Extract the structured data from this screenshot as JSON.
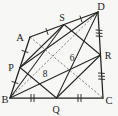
{
  "figure": {
    "background_color": "#fdfdfc",
    "stroke_color": "#202020",
    "dash_color": "#6a6a6a",
    "width": 118,
    "height": 116
  },
  "vertices": {
    "A": {
      "label": "A",
      "x": 30,
      "y": 37,
      "label_x": 21,
      "label_y": 39
    },
    "B": {
      "label": "B",
      "x": 10,
      "y": 98,
      "label_x": 2,
      "label_y": 102
    },
    "C": {
      "label": "C",
      "x": 103,
      "y": 98,
      "label_x": 105,
      "label_y": 103
    },
    "D": {
      "label": "D",
      "x": 98,
      "y": 12,
      "label_x": 98,
      "label_y": 10
    }
  },
  "midpoints": {
    "P": {
      "label": "P",
      "x": 20,
      "y": 67.5,
      "label_x": 9,
      "label_y": 71,
      "on_edge": "AB"
    },
    "Q": {
      "label": "Q",
      "x": 56.5,
      "y": 98,
      "label_x": 53,
      "label_y": 112,
      "on_edge": "BC"
    },
    "R": {
      "label": "R",
      "x": 100.5,
      "y": 55,
      "label_x": 104,
      "label_y": 59,
      "on_edge": "CD"
    },
    "S": {
      "label": "S",
      "x": 64,
      "y": 24.5,
      "label_x": 59,
      "label_y": 21,
      "on_edge": "DA"
    }
  },
  "diagonals": [
    {
      "name": "AC",
      "from": "A",
      "to": "C",
      "style": "dashed",
      "length_label": "8",
      "label_x": 45,
      "label_y": 76
    },
    {
      "name": "BD",
      "from": "B",
      "to": "D",
      "style": "dashed",
      "length_label": "6",
      "label_x": 71,
      "label_y": 61
    }
  ],
  "measure_labels": {
    "ac_length": "8",
    "bd_length": "6"
  },
  "tick_marks": {
    "AP": 1,
    "PB": 1,
    "BQ": 2,
    "QC": 2,
    "CR": 3,
    "RD": 3,
    "DS": 1,
    "SA": 1
  },
  "outer_quadrilateral": {
    "name": "ABCD",
    "order": [
      "A",
      "B",
      "C",
      "D"
    ],
    "style": "solid"
  },
  "inner_quadrilateral": {
    "name": "PQRS",
    "order": [
      "P",
      "Q",
      "R",
      "S"
    ],
    "style": "solid"
  }
}
